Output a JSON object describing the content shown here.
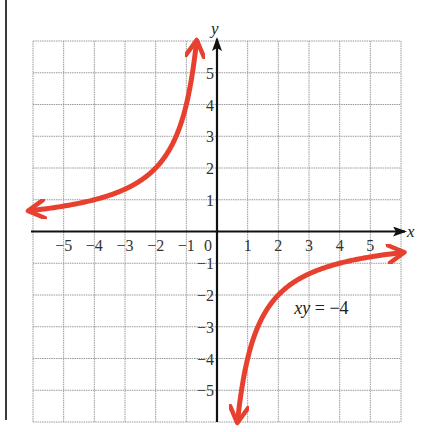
{
  "chart_data": {
    "type": "line",
    "title": "",
    "xlabel": "x",
    "ylabel": "y",
    "xlim": [
      -6,
      6
    ],
    "ylim": [
      -6,
      6
    ],
    "grid": true,
    "x_ticks": [
      -5,
      -4,
      -3,
      -2,
      -1,
      0,
      1,
      2,
      3,
      4,
      5
    ],
    "x_tick_labels": [
      "−5",
      "−4",
      "−3",
      "−2",
      "−1",
      "0",
      "1",
      "2",
      "3",
      "4",
      "5"
    ],
    "y_ticks": [
      -5,
      -4,
      -3,
      -2,
      -1,
      1,
      2,
      3,
      4,
      5
    ],
    "y_tick_labels": [
      "−5",
      "−4",
      "−3",
      "−2",
      "−1",
      "1",
      "2",
      "3",
      "4",
      "5"
    ],
    "series": [
      {
        "name": "xy = −4 (quadrant II branch)",
        "equation": "xy = -4",
        "x_range": [
          -6.1,
          -0.67
        ],
        "arrows": "both",
        "color": "#e8402f"
      },
      {
        "name": "xy = −4 (quadrant IV branch)",
        "equation": "xy = -4",
        "x_range": [
          0.67,
          6.05
        ],
        "arrows": "both",
        "color": "#e8402f"
      }
    ],
    "annotations": [
      {
        "text_italic": "xy",
        "text_rest": " = −4",
        "x": 3.5,
        "y": -2.6
      }
    ]
  },
  "colors": {
    "grid": "#9a9a9a",
    "axis": "#111111",
    "curve": "#e8402f"
  }
}
